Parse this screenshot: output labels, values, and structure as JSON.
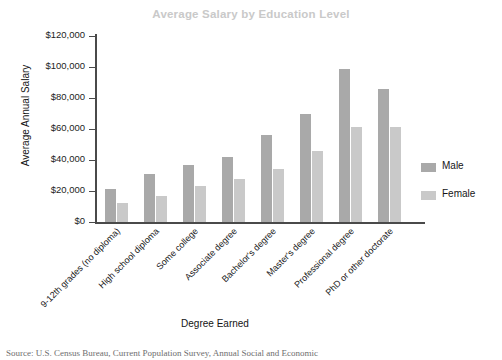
{
  "chart_data": {
    "type": "bar",
    "title": "Average Salary by Education Level",
    "xlabel": "Degree Earned",
    "ylabel": "Average Annual Salary",
    "ylim": [
      0,
      120000
    ],
    "ytick_values": [
      120000,
      100000,
      80000,
      60000,
      40000,
      20000,
      0
    ],
    "ytick_labels": [
      "$120,000",
      "$100,000",
      "$80,000",
      "$60,000",
      "$40,000",
      "$20,000",
      "$0"
    ],
    "grid": false,
    "legend_position": "right",
    "categories": [
      "9-12th grades (no diploma)",
      "High school diploma",
      "Some college",
      "Associate degree",
      "Bachelor's degree",
      "Master's degree",
      "Professional degree",
      "PhD or other doctorate"
    ],
    "series": [
      {
        "name": "Male",
        "color": "#a9a9a9",
        "values": [
          21000,
          31000,
          37000,
          42000,
          56000,
          70000,
          99000,
          86000
        ]
      },
      {
        "name": "Female",
        "color": "#c9c9c9",
        "values": [
          12000,
          17000,
          23000,
          28000,
          34000,
          46000,
          61000,
          61000
        ]
      }
    ]
  },
  "source_note": "Source: U.S. Census Bureau, Current Population Survey, Annual Social and Economic",
  "colors": {
    "title": "#c9c9c9",
    "axis": "#4a4a4a",
    "male": "#a9a9a9",
    "female": "#c9c9c9",
    "text": "#171717"
  }
}
